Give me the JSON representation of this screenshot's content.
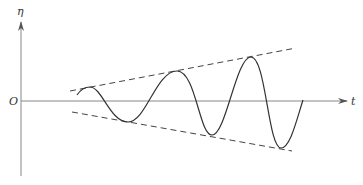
{
  "diagram": {
    "type": "growing oscillation with linear envelope",
    "axes": {
      "x_label": "t",
      "y_label": "η",
      "origin_label": "O"
    },
    "curve": {
      "description": "oscillation with linearly increasing amplitude",
      "peaks": 3,
      "troughs": 3
    },
    "envelope": {
      "style": "dashed",
      "description": "upper and lower linear envelope lines diverging with t"
    },
    "colors": {
      "line": "#333333",
      "axis": "#777777",
      "background": "#ffffff"
    }
  }
}
